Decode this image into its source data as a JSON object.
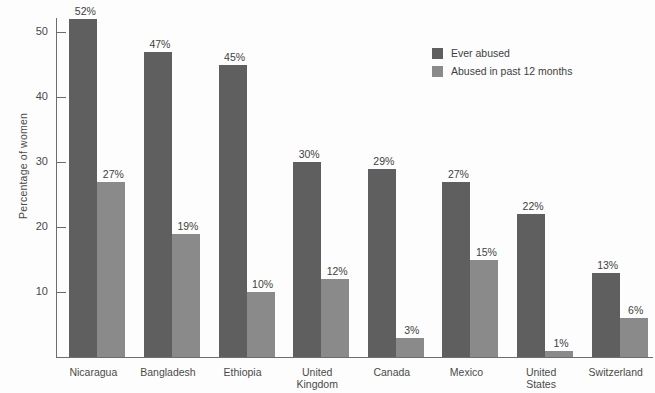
{
  "chart_data": {
    "type": "bar",
    "title": "",
    "subtitle": "",
    "xlabel": "",
    "ylabel": "Percentage of women",
    "ylim": [
      0,
      55
    ],
    "yticks": [
      10,
      20,
      30,
      40,
      50
    ],
    "ytick_labels": [
      "10",
      "20",
      "30",
      "40",
      "50"
    ],
    "grid": false,
    "legend_position": "upper-right",
    "value_label_suffix": "%",
    "categories": [
      "Nicaragua",
      "Bangladesh",
      "Ethiopia",
      "United Kingdom",
      "Canada",
      "Mexico",
      "United States",
      "Switzerland"
    ],
    "category_lines": [
      [
        "Nicaragua"
      ],
      [
        "Bangladesh"
      ],
      [
        "Ethiopia"
      ],
      [
        "United",
        "Kingdom"
      ],
      [
        "Canada"
      ],
      [
        "Mexico"
      ],
      [
        "United",
        "States"
      ],
      [
        "Switzerland"
      ]
    ],
    "series": [
      {
        "name": "Ever abused",
        "color": "#5f5f5f",
        "values": [
          52,
          47,
          45,
          30,
          29,
          27,
          22,
          13
        ],
        "labels": [
          "52%",
          "47%",
          "45%",
          "30%",
          "29%",
          "27%",
          "22%",
          "13%"
        ]
      },
      {
        "name": "Abused in past 12 months",
        "color": "#8a8a8a",
        "values": [
          27,
          19,
          10,
          12,
          3,
          15,
          1,
          6
        ],
        "labels": [
          "27%",
          "19%",
          "10%",
          "12%",
          "3%",
          "15%",
          "1%",
          "6%"
        ]
      }
    ]
  },
  "legend": {
    "items": [
      {
        "label": "Ever abused",
        "color": "#5f5f5f"
      },
      {
        "label": "Abused in past 12 months",
        "color": "#8a8a8a"
      }
    ]
  },
  "axes": {
    "y_title": "Percentage of women"
  }
}
